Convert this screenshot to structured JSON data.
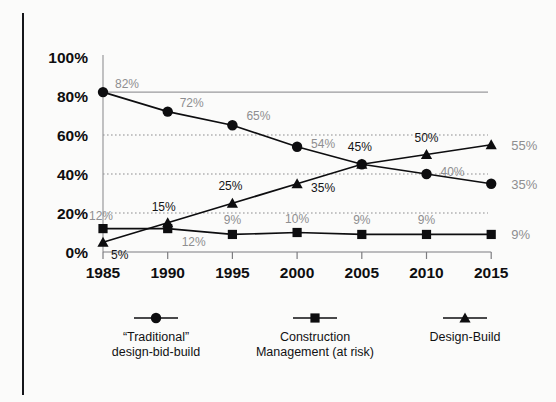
{
  "chart_data": {
    "type": "line",
    "title": "",
    "xlabel": "",
    "ylabel": "",
    "categories": [
      "1985",
      "1990",
      "1995",
      "2000",
      "2005",
      "2010",
      "2015"
    ],
    "ylim": [
      0,
      100
    ],
    "yticks": [
      "0%",
      "20%",
      "40%",
      "60%",
      "80%",
      "100%"
    ],
    "ytick_values": [
      0,
      20,
      40,
      60,
      80,
      100
    ],
    "grid": "horizontal dotted gridlines at 20%, 40%, 60%; solid gray reference line at 82%",
    "legend_position": "bottom",
    "series": [
      {
        "name": "“Traditional” design-bid-build",
        "marker": "circle",
        "values": [
          82,
          72,
          65,
          54,
          45,
          40,
          35
        ],
        "labels": [
          "82%",
          "72%",
          "65%",
          "54%",
          "45%",
          "40%",
          "35%"
        ],
        "label_colors": [
          "gray",
          "gray",
          "gray",
          "gray",
          "dark",
          "gray",
          "gray"
        ],
        "end_label": "35%"
      },
      {
        "name": "Construction Management (at risk)",
        "marker": "square",
        "values": [
          12,
          12,
          9,
          10,
          9,
          9,
          9
        ],
        "labels": [
          "12%",
          "12%",
          "9%",
          "10%",
          "9%",
          "9%",
          "9%"
        ],
        "label_colors": [
          "gray",
          "gray",
          "gray",
          "gray",
          "gray",
          "gray",
          "gray"
        ],
        "end_label": "9%"
      },
      {
        "name": "Design-Build",
        "marker": "triangle",
        "values": [
          5,
          15,
          25,
          35,
          45,
          50,
          55
        ],
        "labels": [
          "5%",
          "15%",
          "25%",
          "35%",
          "45%",
          "50%",
          "55%"
        ],
        "label_colors": [
          "dark",
          "dark",
          "dark",
          "dark",
          "dark",
          "dark",
          "dark"
        ],
        "end_label": "55%"
      }
    ],
    "reference_line_value": 82,
    "colors": {
      "series": "#0d0d0f",
      "label_gray": "#8e8e90",
      "label_dark": "#141416",
      "gridline": "#8d8d8f",
      "background": "#fbfbfa"
    }
  },
  "legend": {
    "items": [
      {
        "marker": "circle",
        "line1": "“Traditional”",
        "line2": "design-bid-build"
      },
      {
        "marker": "square",
        "line1": "Construction",
        "line2": "Management (at risk)"
      },
      {
        "marker": "triangle",
        "line1": "Design-Build",
        "line2": ""
      }
    ]
  },
  "axes": {
    "y_labels": [
      "100%",
      "80%",
      "60%",
      "40%",
      "20%",
      "0%"
    ],
    "x_labels": [
      "1985",
      "1990",
      "1995",
      "2000",
      "2005",
      "2010",
      "2015"
    ]
  },
  "end_labels": [
    "55%",
    "35%",
    "9%"
  ]
}
